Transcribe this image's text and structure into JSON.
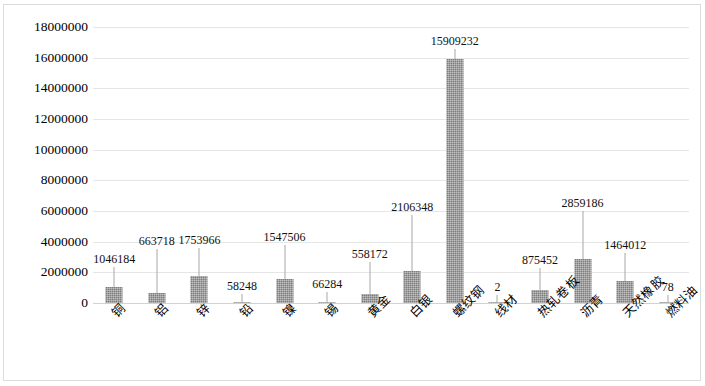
{
  "chart_data": {
    "type": "bar",
    "title": "",
    "subtitle": "",
    "xlabel": "",
    "ylabel": "",
    "categories": [
      "铜",
      "铝",
      "锌",
      "铅",
      "镍",
      "锡",
      "黄金",
      "白银",
      "螺纹钢",
      "线材",
      "热轧卷板",
      "沥青",
      "天然橡胶",
      "燃料油"
    ],
    "values": [
      1046184,
      663718,
      1753966,
      58248,
      1547506,
      66284,
      558172,
      2106348,
      15909232,
      2,
      875452,
      2859186,
      1464012,
      78
    ],
    "data_labels": [
      "1046184",
      "663718",
      "1753966",
      "58248",
      "1547506",
      "66284",
      "558172",
      "2106348",
      "15909232",
      "2",
      "875452",
      "2859186",
      "1464012",
      "78"
    ],
    "ylim": [
      0,
      18000000
    ],
    "ytick_step": 2000000,
    "ytick_values": [
      0,
      2000000,
      4000000,
      6000000,
      8000000,
      10000000,
      12000000,
      14000000,
      16000000,
      18000000
    ],
    "ytick_labels": [
      "0",
      "2000000",
      "4000000",
      "6000000",
      "8000000",
      "10000000",
      "12000000",
      "14000000",
      "16000000",
      "18000000"
    ],
    "grid": true,
    "grid_axis": "y",
    "legend": false,
    "legend_position": "none",
    "series": [
      {
        "name": "",
        "values": [
          1046184,
          663718,
          1753966,
          58248,
          1547506,
          66284,
          558172,
          2106348,
          15909232,
          2,
          875452,
          2859186,
          1464012,
          78
        ]
      }
    ]
  },
  "style": {
    "bar_color": "#7d7d7d",
    "gridline_color": "#e6e6e6",
    "axis_color": "#d2d2d2",
    "border_color": "#dcdcdc",
    "text_color": "#000000",
    "background": "#ffffff",
    "label_rotation_deg": -45
  }
}
